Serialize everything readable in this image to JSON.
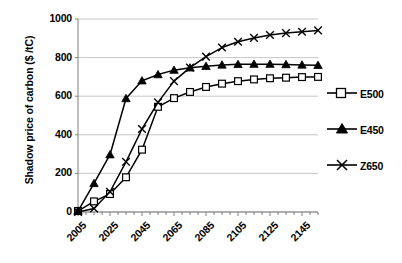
{
  "chart_data": {
    "type": "line",
    "title": "",
    "xlabel": "",
    "ylabel": "Shadow price of carbon ($ /tC)",
    "xlim": [
      2005,
      2155
    ],
    "ylim": [
      0,
      1000
    ],
    "ytick_values": [
      0,
      200,
      400,
      600,
      800,
      1000
    ],
    "ytick_labels": [
      "0",
      "200",
      "400",
      "600",
      "800",
      "1000"
    ],
    "xtick_values": [
      2005,
      2025,
      2045,
      2065,
      2085,
      2105,
      2125,
      2145
    ],
    "xtick_labels": [
      "2005",
      "2025",
      "2045",
      "2065",
      "2085",
      "2105",
      "2125",
      "2145"
    ],
    "x_minor_tick_interval": 5,
    "grid": "horizontal",
    "legend_position": "right",
    "x": [
      2005,
      2015,
      2025,
      2035,
      2045,
      2055,
      2065,
      2075,
      2085,
      2095,
      2105,
      2115,
      2125,
      2135,
      2145,
      2155
    ],
    "series": [
      {
        "name": "E500",
        "marker": "open-square",
        "color": "#000000",
        "values": [
          5,
          55,
          93,
          180,
          323,
          545,
          590,
          622,
          648,
          665,
          678,
          687,
          693,
          696,
          699,
          700
        ]
      },
      {
        "name": "E450",
        "marker": "filled-triangle",
        "color": "#000000",
        "values": [
          5,
          148,
          297,
          588,
          680,
          712,
          735,
          747,
          755,
          762,
          765,
          766,
          766,
          764,
          762,
          760
        ]
      },
      {
        "name": "Z650",
        "marker": "cross-x",
        "color": "#000000",
        "values": [
          0,
          18,
          105,
          260,
          430,
          568,
          678,
          748,
          805,
          852,
          882,
          902,
          917,
          927,
          934,
          941
        ]
      }
    ]
  },
  "legend": {
    "items": [
      {
        "label": "E500"
      },
      {
        "label": "E450"
      },
      {
        "label": "Z650"
      }
    ]
  },
  "axes": {
    "y_title": "Shadow price of carbon ($ /tC)"
  }
}
